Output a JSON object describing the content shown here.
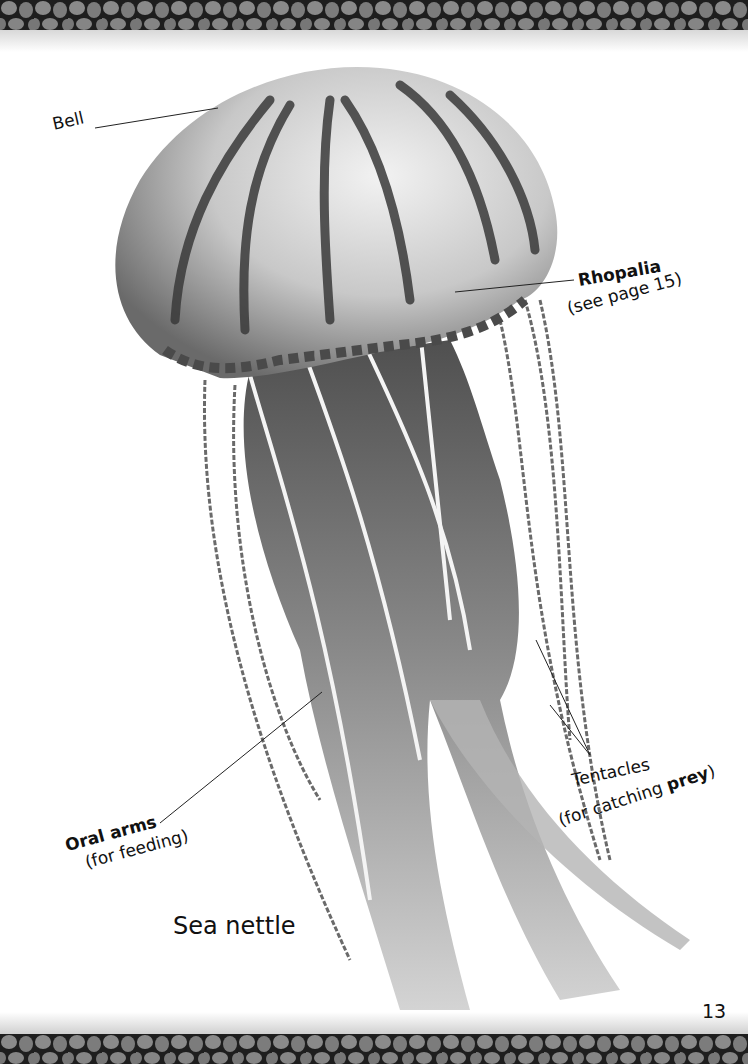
{
  "page": {
    "number": "13",
    "caption": "Sea nettle"
  },
  "labels": {
    "bell": {
      "text": "Bell"
    },
    "rhopalia": {
      "title": "Rhopalia",
      "note": "(see page 15)"
    },
    "tentacles": {
      "title": "Tentacles",
      "note_prefix": "(for catching ",
      "note_bold": "prey",
      "note_suffix": ")"
    },
    "oral_arms": {
      "title": "Oral arms",
      "note": "(for feeding)"
    }
  },
  "illustration": {
    "subject": "jellyfish-sea-nettle",
    "style": "grayscale painting"
  },
  "colors": {
    "border": "#2a2a2a",
    "border_cells": "#8a8a8a",
    "bell_light": "#d9d9d9",
    "bell_dark": "#3a3a3a",
    "arms": "#9a9a9a"
  }
}
